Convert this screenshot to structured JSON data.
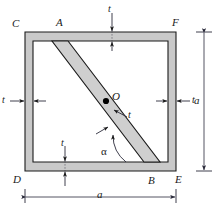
{
  "figure": {
    "colors": {
      "wall_fill": "#c8c8c8",
      "wall_fill_light": "#d8d8d8",
      "interior": "#ffffff",
      "outline": "#1a1a1a",
      "dimension_line": "#3a3a4a",
      "point_marker": "#000000"
    },
    "vertices": {
      "C": "C",
      "A": "A",
      "F": "F",
      "D": "D",
      "B": "B",
      "E": "E",
      "O": "O"
    },
    "dimensions": {
      "width_label": "a",
      "height_label": "a",
      "thickness_top": "t",
      "thickness_left": "t",
      "thickness_right": "t",
      "thickness_bottom": "t",
      "thickness_diagonal": "t",
      "angle_label": "α"
    }
  }
}
